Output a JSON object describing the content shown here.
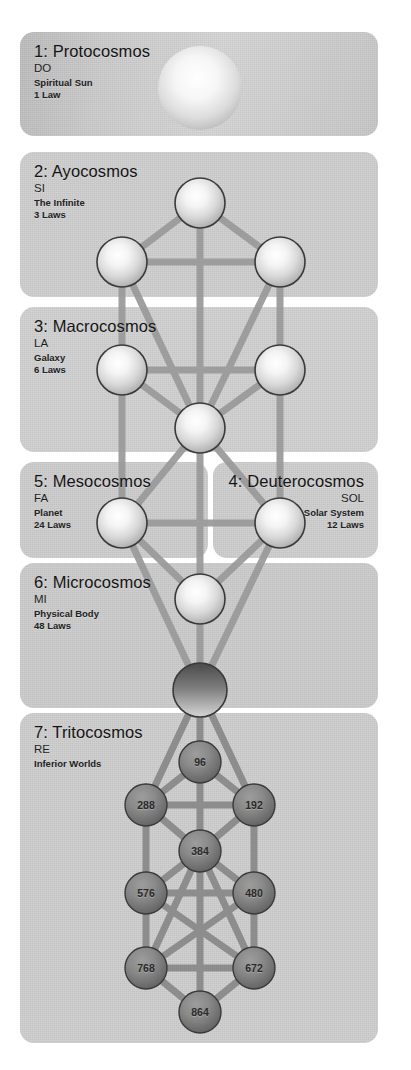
{
  "diagram": {
    "type": "kabbalistic-tree-of-life",
    "panels": [
      {
        "id": "protocosmos",
        "title": "1: Protocosmos",
        "note": "DO",
        "sub1": "Spiritual Sun",
        "sub2": "1 Law",
        "align": "left",
        "tone": "tone-a"
      },
      {
        "id": "ayocosmos",
        "title": "2: Ayocosmos",
        "note": "SI",
        "sub1": "The Infinite",
        "sub2": "3 Laws",
        "align": "left",
        "tone": "tone-b"
      },
      {
        "id": "macrocosmos",
        "title": "3: Macrocosmos",
        "note": "LA",
        "sub1": "Galaxy",
        "sub2": "6 Laws",
        "align": "left",
        "tone": "tone-c"
      },
      {
        "id": "mesocosmos",
        "title": "5: Mesocosmos",
        "note": "FA",
        "sub1": "Planet",
        "sub2": "24 Laws",
        "align": "left",
        "tone": "tone-d"
      },
      {
        "id": "deuterocosmos",
        "title": "4: Deuterocosmos",
        "note": "SOL",
        "sub1": "Solar System",
        "sub2": "12 Laws",
        "align": "right",
        "tone": "tone-e"
      },
      {
        "id": "microcosmos",
        "title": "6: Microcosmos",
        "note": "MI",
        "sub1": "Physical Body",
        "sub2": "48 Laws",
        "align": "left",
        "tone": "tone-f"
      },
      {
        "id": "tritocosmos",
        "title": "7: Tritocosmos",
        "note": "RE",
        "sub1": "Inferior Worlds",
        "sub2": "",
        "align": "left",
        "tone": "tone-g"
      }
    ],
    "nodes": {
      "sun": {
        "label": ""
      },
      "kether": {
        "label": ""
      },
      "chokmah": {
        "label": ""
      },
      "binah": {
        "label": ""
      },
      "chesed": {
        "label": ""
      },
      "geburah": {
        "label": ""
      },
      "tiphereth": {
        "label": ""
      },
      "netzach": {
        "label": ""
      },
      "hod": {
        "label": ""
      },
      "yesod": {
        "label": ""
      },
      "malkuth": {
        "label": ""
      },
      "inferno1": {
        "label": "96"
      },
      "inferno2": {
        "label": "288"
      },
      "inferno3": {
        "label": "192"
      },
      "inferno4": {
        "label": "384"
      },
      "inferno5": {
        "label": "576"
      },
      "inferno6": {
        "label": "480"
      },
      "inferno7": {
        "label": "768"
      },
      "inferno8": {
        "label": "672"
      },
      "inferno9": {
        "label": "864"
      }
    },
    "colors": {
      "panel_bg": "#cbcbcb",
      "page_bg": "#ffffff",
      "path": "#9a9a9a",
      "sphere_light": "#ffffff",
      "sphere_edge": "#2e2e2e",
      "sphere_dark": "#6e6e6e",
      "text": "#1b1b1b"
    }
  }
}
